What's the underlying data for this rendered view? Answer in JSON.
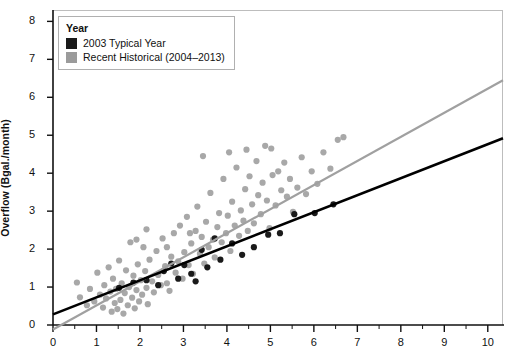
{
  "chart_data": {
    "type": "scatter",
    "title": "",
    "xlabel": "",
    "ylabel": "Overflow (Bgal./month)",
    "xlim": [
      0,
      10.35
    ],
    "ylim": [
      0,
      8.3
    ],
    "xticks": [
      0,
      1,
      2,
      3,
      4,
      5,
      6,
      7,
      8,
      9,
      10
    ],
    "yticks": [
      0,
      1,
      2,
      3,
      4,
      5,
      6,
      7,
      8
    ],
    "xminor_step": 0.5,
    "grid": false,
    "legend": {
      "title": "Year",
      "position": "top-left",
      "entries": [
        {
          "label": "2003 Typical Year",
          "color": "#1a1a1a"
        },
        {
          "label": "Recent Historical (2004–2013)",
          "color": "#9b9b9b"
        }
      ]
    },
    "series": [
      {
        "name": "Recent Historical (2004–2013)",
        "color": "#a8a8a8",
        "marker": "circle",
        "points": [
          [
            0.55,
            1.12
          ],
          [
            0.62,
            0.73
          ],
          [
            0.78,
            0.52
          ],
          [
            0.85,
            0.95
          ],
          [
            0.95,
            0.62
          ],
          [
            1.02,
            1.38
          ],
          [
            1.08,
            0.8
          ],
          [
            1.15,
            0.46
          ],
          [
            1.18,
            1.05
          ],
          [
            1.22,
            0.7
          ],
          [
            1.28,
            1.52
          ],
          [
            1.32,
            0.88
          ],
          [
            1.35,
            0.35
          ],
          [
            1.38,
            1.22
          ],
          [
            1.42,
            0.58
          ],
          [
            1.45,
            0.95
          ],
          [
            1.48,
            0.42
          ],
          [
            1.52,
            1.7
          ],
          [
            1.55,
            0.66
          ],
          [
            1.58,
            1.1
          ],
          [
            1.62,
            0.3
          ],
          [
            1.65,
            0.84
          ],
          [
            1.68,
            1.44
          ],
          [
            1.72,
            0.52
          ],
          [
            1.75,
            1.0
          ],
          [
            1.78,
            2.18
          ],
          [
            1.82,
            0.72
          ],
          [
            1.85,
            1.3
          ],
          [
            1.88,
            0.44
          ],
          [
            1.92,
            0.92
          ],
          [
            1.95,
            1.6
          ],
          [
            1.98,
            0.62
          ],
          [
            2.02,
            1.18
          ],
          [
            2.05,
            0.8
          ],
          [
            2.08,
            2.05
          ],
          [
            2.12,
            1.42
          ],
          [
            2.15,
            0.98
          ],
          [
            2.18,
            0.55
          ],
          [
            2.22,
            1.72
          ],
          [
            2.28,
            1.15
          ],
          [
            2.32,
            0.86
          ],
          [
            2.38,
            1.95
          ],
          [
            2.42,
            1.32
          ],
          [
            2.48,
            1.05
          ],
          [
            2.52,
            2.28
          ],
          [
            2.58,
            1.55
          ],
          [
            2.62,
            1.1
          ],
          [
            2.68,
            0.9
          ],
          [
            2.72,
            1.8
          ],
          [
            2.78,
            2.42
          ],
          [
            2.82,
            1.38
          ],
          [
            2.88,
            1.68
          ],
          [
            2.92,
            2.62
          ],
          [
            2.98,
            1.22
          ],
          [
            3.02,
            1.92
          ],
          [
            3.08,
            2.85
          ],
          [
            3.12,
            1.58
          ],
          [
            3.18,
            2.15
          ],
          [
            3.22,
            1.35
          ],
          [
            3.28,
            2.48
          ],
          [
            3.32,
            3.12
          ],
          [
            3.38,
            1.88
          ],
          [
            3.42,
            2.32
          ],
          [
            3.48,
            1.62
          ],
          [
            3.52,
            2.72
          ],
          [
            3.58,
            2.05
          ],
          [
            3.62,
            3.48
          ],
          [
            3.68,
            2.25
          ],
          [
            3.72,
            1.78
          ],
          [
            3.78,
            2.58
          ],
          [
            3.82,
            2.95
          ],
          [
            3.88,
            2.18
          ],
          [
            3.92,
            3.85
          ],
          [
            3.98,
            2.42
          ],
          [
            4.02,
            2.88
          ],
          [
            4.08,
            1.95
          ],
          [
            4.12,
            3.25
          ],
          [
            4.18,
            2.62
          ],
          [
            4.22,
            4.15
          ],
          [
            4.28,
            2.35
          ],
          [
            4.32,
            3.02
          ],
          [
            4.38,
            2.75
          ],
          [
            4.42,
            3.58
          ],
          [
            4.48,
            2.48
          ],
          [
            4.52,
            3.92
          ],
          [
            4.58,
            3.18
          ],
          [
            4.62,
            2.68
          ],
          [
            4.68,
            4.32
          ],
          [
            4.72,
            3.42
          ],
          [
            4.78,
            2.92
          ],
          [
            4.82,
            3.75
          ],
          [
            4.88,
            4.72
          ],
          [
            4.92,
            3.28
          ],
          [
            4.98,
            2.55
          ],
          [
            5.05,
            3.95
          ],
          [
            5.12,
            3.15
          ],
          [
            5.18,
            4.05
          ],
          [
            5.25,
            3.55
          ],
          [
            5.32,
            4.28
          ],
          [
            5.38,
            3.38
          ],
          [
            5.45,
            3.85
          ],
          [
            5.52,
            2.98
          ],
          [
            5.62,
            3.62
          ],
          [
            5.72,
            4.42
          ],
          [
            5.82,
            3.45
          ],
          [
            5.95,
            4.05
          ],
          [
            6.08,
            3.72
          ],
          [
            6.22,
            4.55
          ],
          [
            6.38,
            4.12
          ],
          [
            6.55,
            4.88
          ],
          [
            6.68,
            4.95
          ],
          [
            3.45,
            4.45
          ],
          [
            4.05,
            4.55
          ],
          [
            4.45,
            4.62
          ],
          [
            5.02,
            4.65
          ],
          [
            2.15,
            2.52
          ],
          [
            1.92,
            2.25
          ],
          [
            2.62,
            2.05
          ],
          [
            3.15,
            2.42
          ]
        ]
      },
      {
        "name": "2003 Typical Year",
        "color": "#1a1a1a",
        "marker": "circle",
        "points": [
          [
            1.52,
            0.98
          ],
          [
            1.85,
            1.12
          ],
          [
            2.15,
            1.18
          ],
          [
            2.42,
            1.05
          ],
          [
            2.55,
            1.42
          ],
          [
            2.88,
            1.22
          ],
          [
            3.02,
            1.58
          ],
          [
            3.18,
            1.35
          ],
          [
            3.42,
            1.98
          ],
          [
            3.55,
            1.52
          ],
          [
            3.72,
            2.28
          ],
          [
            3.85,
            1.72
          ],
          [
            4.12,
            2.15
          ],
          [
            4.35,
            1.85
          ],
          [
            4.62,
            2.05
          ],
          [
            4.95,
            2.38
          ],
          [
            5.22,
            2.42
          ],
          [
            5.55,
            2.92
          ],
          [
            6.02,
            2.95
          ],
          [
            6.45,
            3.18
          ],
          [
            2.72,
            1.62
          ],
          [
            3.28,
            1.15
          ]
        ]
      }
    ],
    "trendlines": [
      {
        "name": "2003 Typical Year trend",
        "color": "#000000",
        "width": 2.6,
        "x0": 0.0,
        "y0": 0.28,
        "x1": 10.35,
        "y1": 4.92
      },
      {
        "name": "Recent Historical trend",
        "color": "#a0a0a0",
        "width": 2.2,
        "x0": 0.0,
        "y0": -0.12,
        "x1": 10.35,
        "y1": 6.45
      }
    ]
  }
}
